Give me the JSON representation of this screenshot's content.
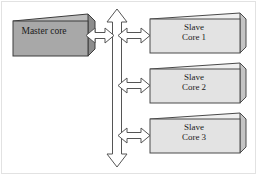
{
  "figure": {
    "background_color": "#ffffff",
    "frame_color": "#e2e2e2"
  },
  "nodes": {
    "master": {
      "label": "Master core",
      "fill_color": "#a8a8a8",
      "side_color": "#8d8d8d",
      "top_color": "#bdbdbd",
      "stroke_color": "#3c3c3c"
    },
    "slaves": [
      {
        "label": "Slave\nCore 1",
        "fill_color": "#e3e3e3",
        "side_color": "#c4c4c4",
        "top_color": "#f0f0f0",
        "stroke_color": "#4a4a4a"
      },
      {
        "label": "Slave\nCore 2",
        "fill_color": "#e3e3e3",
        "side_color": "#c4c4c4",
        "top_color": "#f0f0f0",
        "stroke_color": "#4a4a4a"
      },
      {
        "label": "Slave\nCore 3",
        "fill_color": "#e3e3e3",
        "side_color": "#c4c4c4",
        "top_color": "#f0f0f0",
        "stroke_color": "#4a4a4a"
      }
    ]
  },
  "connectors": {
    "vertical_bus": {
      "name": "vertical-bus-double-arrow",
      "direction": "bidirectional-vertical",
      "fill_color": "#ffffff",
      "stroke_color": "#555555"
    },
    "master_link": {
      "name": "master-to-bus-arrow",
      "direction": "bidirectional-horizontal",
      "fill_color": "#ffffff",
      "stroke_color": "#555555"
    },
    "slave_links": [
      {
        "name": "bus-to-slave-1-arrow",
        "direction": "bidirectional-horizontal",
        "fill_color": "#ffffff",
        "stroke_color": "#555555"
      },
      {
        "name": "bus-to-slave-2-arrow",
        "direction": "bidirectional-horizontal",
        "fill_color": "#ffffff",
        "stroke_color": "#555555"
      },
      {
        "name": "bus-to-slave-3-arrow",
        "direction": "bidirectional-horizontal",
        "fill_color": "#ffffff",
        "stroke_color": "#555555"
      }
    ]
  }
}
